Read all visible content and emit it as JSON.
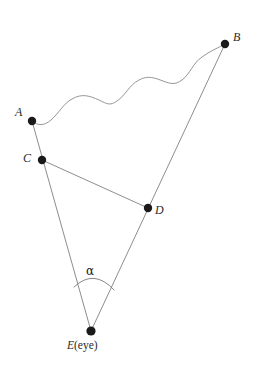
{
  "figure": {
    "type": "geometry-diagram",
    "canvas": {
      "width": 273,
      "height": 383,
      "background": "#ffffff"
    },
    "style": {
      "line_color": "#808080",
      "line_width": 0.9,
      "curve_color": "#8a8a8a",
      "curve_width": 0.9,
      "point_color": "#1a1a1a",
      "point_radius": 4.2,
      "label_color": "#2b2b2b",
      "arc_color": "#707070"
    },
    "points": [
      {
        "id": "A",
        "label": "A",
        "x": 32,
        "y": 121,
        "label_x": 15,
        "label_y": 106
      },
      {
        "id": "B",
        "label": "B",
        "x": 225,
        "y": 44,
        "label_x": 233,
        "label_y": 31
      },
      {
        "id": "C",
        "label": "C",
        "x": 42,
        "y": 160,
        "label_x": 23,
        "label_y": 152
      },
      {
        "id": "D",
        "label": "D",
        "x": 148,
        "y": 208,
        "label_x": 155,
        "label_y": 204
      },
      {
        "id": "E",
        "label": "E",
        "x": 91,
        "y": 331,
        "label_x": 0,
        "label_y": 0
      }
    ],
    "eye_label": {
      "symbol": "E",
      "annotation": "(eye)",
      "x": 67,
      "y": 340
    },
    "angle": {
      "symbol": "α",
      "vertex": "E",
      "label_x": 86,
      "label_y": 265,
      "arc_start": {
        "x": 74,
        "y": 287
      },
      "arc_end": {
        "x": 114,
        "y": 290
      },
      "arc_ctrl": {
        "x": 94,
        "y": 268
      }
    },
    "segments": [
      {
        "id": "A-E",
        "from": "A",
        "to": "E",
        "through": "C",
        "kind": "sight-line"
      },
      {
        "id": "B-E",
        "from": "B",
        "to": "E",
        "through": "D",
        "kind": "sight-line"
      },
      {
        "id": "C-D",
        "from": "C",
        "to": "D",
        "kind": "chord"
      }
    ],
    "wavy_curve": {
      "id": "A-B-wave",
      "from": "A",
      "to": "B",
      "description": "sinusoidal wavy line joining A and B",
      "undulations": 4,
      "path": "M 32 121 C 38 126 44 126 51 120 C 60 112 63 104 72 99 C 82 93 90 96 99 100 C 107 104 110 106 117 101 C 126 95 129 85 139 80 C 148 75 155 78 163 81 C 171 84 175 85 182 80 C 190 74 193 63 202 57 C 210 51 218 48 225 44"
    }
  }
}
